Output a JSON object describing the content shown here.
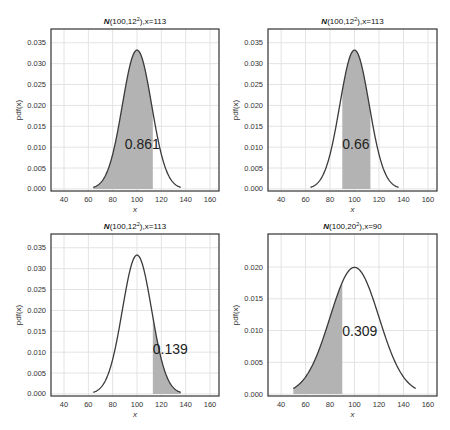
{
  "chart_data": [
    {
      "type": "area",
      "title": "N(100,12²),x=113",
      "title_parts": {
        "dist": "N",
        "args": "(100,12",
        "sup": "2",
        "tail": "),x=113"
      },
      "xlabel": "x",
      "ylabel": "pdf(x)",
      "mu": 100,
      "sigma": 12,
      "curve_range": [
        64,
        136
      ],
      "shade_range": [
        64,
        113
      ],
      "annotation": {
        "text": "0.861",
        "x": 90,
        "y": 0.0105
      },
      "xlim": [
        29.3,
        167.4
      ],
      "ylim": [
        -0.0005,
        0.0383
      ],
      "xticks": [
        40,
        60,
        80,
        100,
        120,
        140,
        160
      ],
      "yticks": [
        0.0,
        0.005,
        0.01,
        0.015,
        0.02,
        0.025,
        0.03,
        0.035
      ],
      "ytick_labels": [
        "0.000",
        "0.005",
        "0.010",
        "0.015",
        "0.020",
        "0.025",
        "0.030",
        "0.035"
      ],
      "grid": true,
      "box": {
        "left": 51,
        "top": 29,
        "right": 219,
        "bottom": 191
      }
    },
    {
      "type": "area",
      "title": "N(100,12²),x=113",
      "title_parts": {
        "dist": "N",
        "args": "(100,12",
        "sup": "2",
        "tail": "),x=113"
      },
      "xlabel": "x",
      "ylabel": "pdf(x)",
      "mu": 100,
      "sigma": 12,
      "curve_range": [
        64,
        136
      ],
      "shade_range": [
        90,
        113
      ],
      "annotation": {
        "text": "0.66",
        "x": 90,
        "y": 0.0105
      },
      "xlim": [
        29.3,
        167.4
      ],
      "ylim": [
        -0.0005,
        0.0383
      ],
      "xticks": [
        40,
        60,
        80,
        100,
        120,
        140,
        160
      ],
      "yticks": [
        0.0,
        0.005,
        0.01,
        0.015,
        0.02,
        0.025,
        0.03,
        0.035
      ],
      "ytick_labels": [
        "0.000",
        "0.005",
        "0.010",
        "0.015",
        "0.020",
        "0.025",
        "0.030",
        "0.035"
      ],
      "grid": true,
      "box": {
        "left": 268,
        "top": 29,
        "right": 437,
        "bottom": 191
      }
    },
    {
      "type": "area",
      "title": "N(100,12²),x=113",
      "title_parts": {
        "dist": "N",
        "args": "(100,12",
        "sup": "2",
        "tail": "),x=113"
      },
      "xlabel": "x",
      "ylabel": "pdf(x)",
      "mu": 100,
      "sigma": 12,
      "curve_range": [
        64,
        136
      ],
      "shade_range": [
        113,
        136
      ],
      "annotation": {
        "text": "0.139",
        "x": 113,
        "y": 0.0105
      },
      "xlim": [
        29.3,
        167.4
      ],
      "ylim": [
        -0.0005,
        0.0383
      ],
      "xticks": [
        40,
        60,
        80,
        100,
        120,
        140,
        160
      ],
      "yticks": [
        0.0,
        0.005,
        0.01,
        0.015,
        0.02,
        0.025,
        0.03,
        0.035
      ],
      "ytick_labels": [
        "0.000",
        "0.005",
        "0.010",
        "0.015",
        "0.020",
        "0.025",
        "0.030",
        "0.035"
      ],
      "grid": true,
      "box": {
        "left": 51,
        "top": 234,
        "right": 219,
        "bottom": 396
      }
    },
    {
      "type": "area",
      "title": "N(100,20²),x=90",
      "title_parts": {
        "dist": "N",
        "args": "(100,20",
        "sup": "2",
        "tail": "),x=90"
      },
      "xlabel": "x",
      "ylabel": "pdf(x)",
      "mu": 100,
      "sigma": 20,
      "curve_range": [
        50,
        150
      ],
      "shade_range": [
        50,
        90
      ],
      "annotation": {
        "text": "0.309",
        "x": 90,
        "y": 0.0098
      },
      "xlim": [
        29.3,
        167.4
      ],
      "ylim": [
        -0.0003,
        0.0252
      ],
      "xticks": [
        40,
        60,
        80,
        100,
        120,
        140,
        160
      ],
      "yticks": [
        0.0,
        0.005,
        0.01,
        0.015,
        0.02
      ],
      "ytick_labels": [
        "0.000",
        "0.005",
        "0.010",
        "0.015",
        "0.020"
      ],
      "grid": true,
      "box": {
        "left": 268,
        "top": 234,
        "right": 437,
        "bottom": 396
      }
    }
  ],
  "colors": {
    "background": "#ffffff",
    "grid": "#e3e3e3",
    "axes_frame": "#333333",
    "curve": "#3a3a3a",
    "fill": "#b3b3b3",
    "tick_text": "#333333",
    "annotation_text": "#222222"
  }
}
